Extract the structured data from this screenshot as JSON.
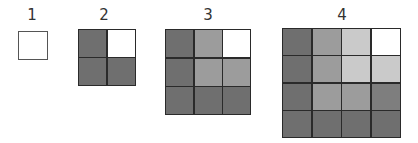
{
  "figure": {
    "palette": {
      "dark": "#6f6f6f",
      "darkmid": "#7e7e7e",
      "mid": "#9c9c9c",
      "midlight": "#b4b4b4",
      "light": "#cacaca",
      "white": "#ffffff"
    },
    "squares": [
      {
        "label": "1",
        "size": 1,
        "rows": [
          [
            "white"
          ]
        ]
      },
      {
        "label": "2",
        "size": 2,
        "rows": [
          [
            "dark",
            "white"
          ],
          [
            "dark",
            "dark"
          ]
        ]
      },
      {
        "label": "3",
        "size": 3,
        "rows": [
          [
            "dark",
            "mid",
            "white"
          ],
          [
            "dark",
            "mid",
            "mid"
          ],
          [
            "dark",
            "dark",
            "dark"
          ]
        ]
      },
      {
        "label": "4",
        "size": 4,
        "rows": [
          [
            "dark",
            "mid",
            "light",
            "white"
          ],
          [
            "dark",
            "mid",
            "light",
            "light"
          ],
          [
            "dark",
            "mid",
            "mid",
            "darkmid"
          ],
          [
            "dark",
            "dark",
            "dark",
            "dark"
          ]
        ]
      }
    ]
  }
}
